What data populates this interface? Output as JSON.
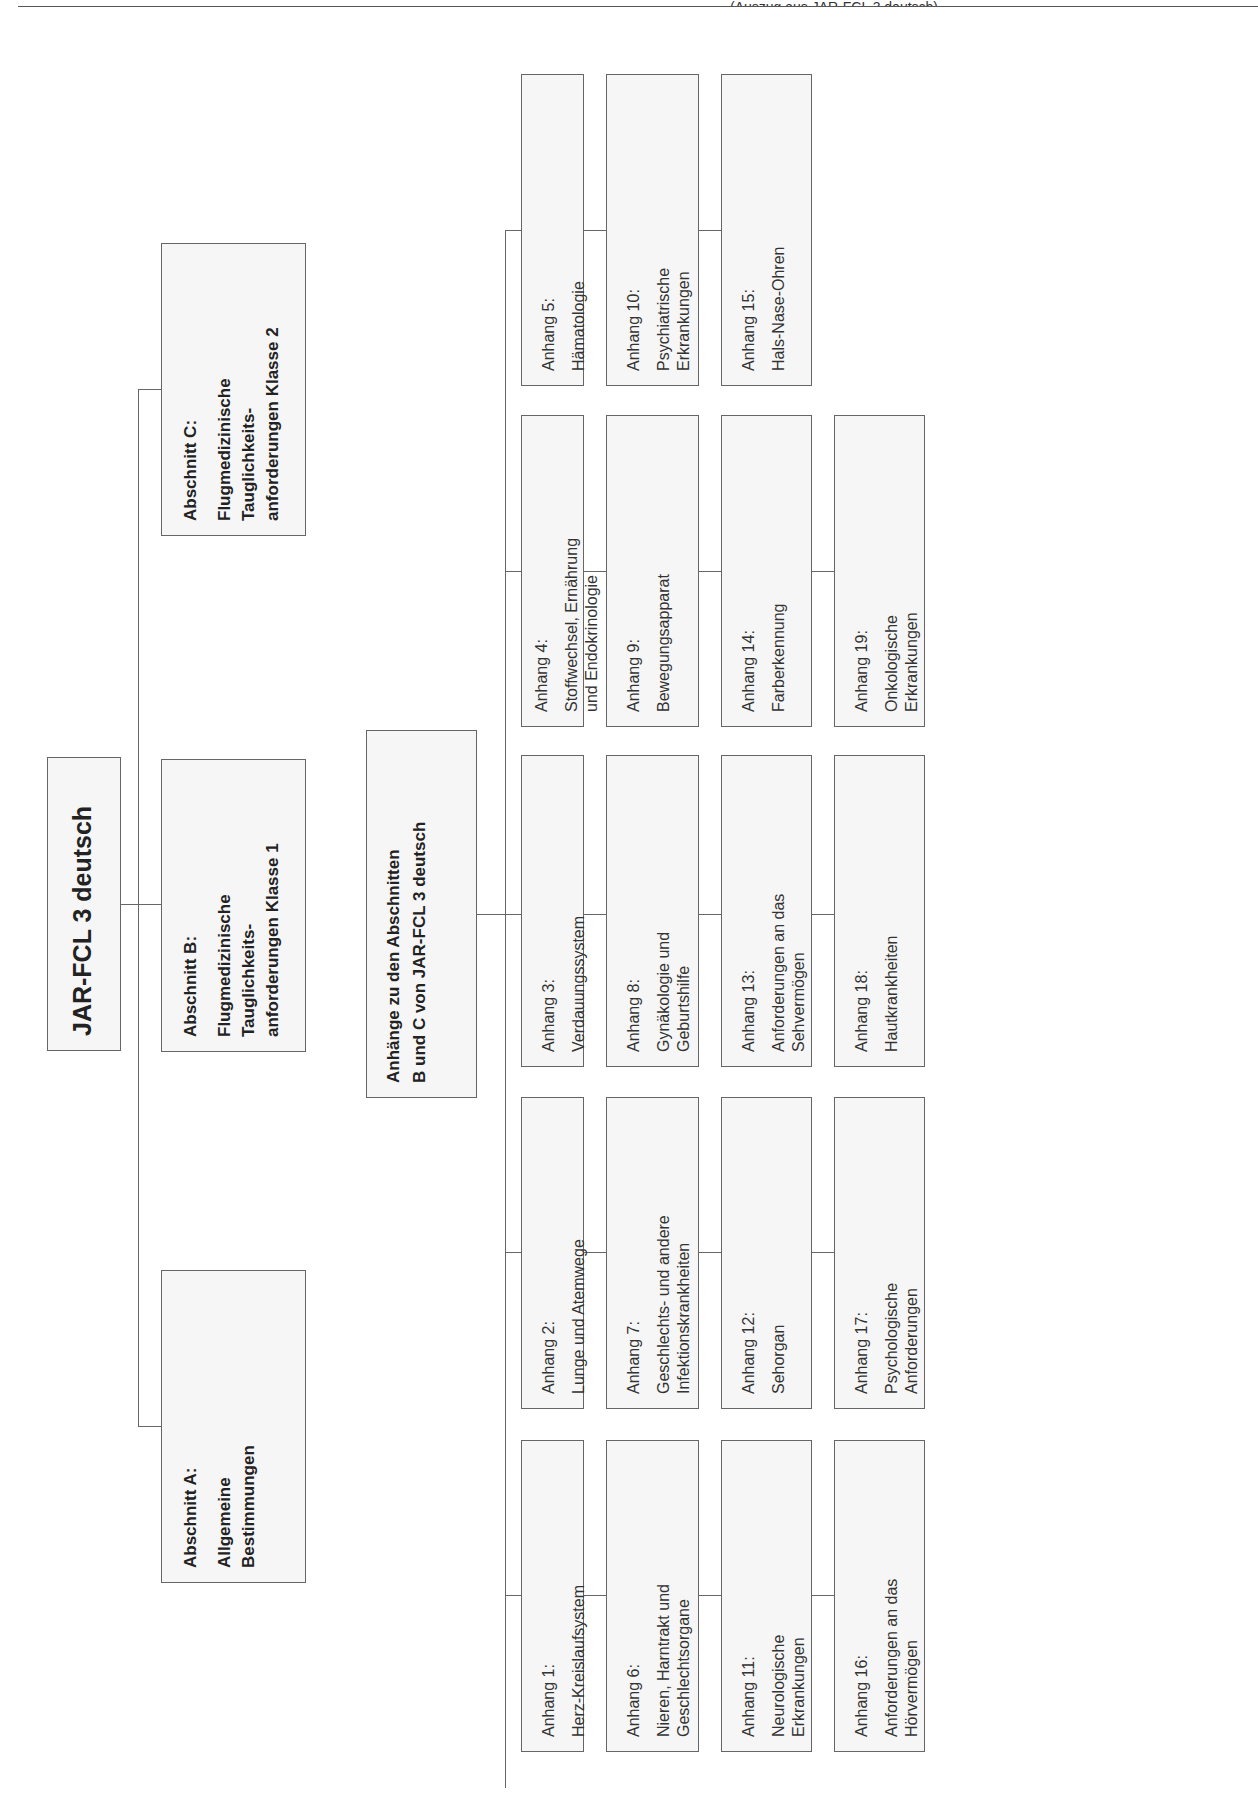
{
  "header": {
    "partial_text": "(Auszug aus JAR-FCL 3 deutsch)"
  },
  "root": {
    "title": "JAR-FCL 3 deutsch"
  },
  "sections": [
    {
      "id": "A",
      "heading": "Abschnitt A:",
      "lines": [
        "Allgemeine",
        "Bestimmungen"
      ]
    },
    {
      "id": "B",
      "heading": "Abschnitt B:",
      "lines": [
        "Flugmedizinische",
        "Tauglichkeits-",
        "anforderungen Klasse 1"
      ]
    },
    {
      "id": "C",
      "heading": "Abschnitt C:",
      "lines": [
        "Flugmedizinische",
        "Tauglichkeits-",
        "anforderungen Klasse 2"
      ]
    }
  ],
  "appendix_group": {
    "lines": [
      "Anhänge zu den Abschnitten",
      "B und C von JAR-FCL 3 deutsch"
    ]
  },
  "appendices": [
    {
      "label": "Anhang 1:",
      "lines": [
        "Herz-Kreislaufsystem"
      ]
    },
    {
      "label": "Anhang 2:",
      "lines": [
        "Lunge und Atemwege"
      ]
    },
    {
      "label": "Anhang 3:",
      "lines": [
        "Verdauungssystem"
      ]
    },
    {
      "label": "Anhang 4:",
      "lines": [
        "Stoffwechsel, Ernährung",
        "und Endokrinologie"
      ]
    },
    {
      "label": "Anhang 5:",
      "lines": [
        "Hämatologie"
      ]
    },
    {
      "label": "Anhang 6:",
      "lines": [
        "Nieren, Harntrakt und",
        "Geschlechtsorgane"
      ]
    },
    {
      "label": "Anhang 7:",
      "lines": [
        "Geschlechts- und andere",
        "Infektionskrankheiten"
      ]
    },
    {
      "label": "Anhang 8:",
      "lines": [
        "Gynäkologie und",
        "Geburtshilfe"
      ]
    },
    {
      "label": "Anhang 9:",
      "lines": [
        "Bewegungsapparat"
      ]
    },
    {
      "label": "Anhang 10:",
      "lines": [
        "Psychiatrische",
        "Erkrankungen"
      ]
    },
    {
      "label": "Anhang 11:",
      "lines": [
        "Neurologische",
        "Erkrankungen"
      ]
    },
    {
      "label": "Anhang 12:",
      "lines": [
        "Sehorgan"
      ]
    },
    {
      "label": "Anhang 13:",
      "lines": [
        "Anforderungen an das",
        "Sehvermögen"
      ]
    },
    {
      "label": "Anhang 14:",
      "lines": [
        "Farberkennung"
      ]
    },
    {
      "label": "Anhang 15:",
      "lines": [
        "Hals-Nase-Ohren"
      ]
    },
    {
      "label": "Anhang 16:",
      "lines": [
        "Anforderungen an das",
        "Hörvermögen"
      ]
    },
    {
      "label": "Anhang 17:",
      "lines": [
        "Psychologische",
        "Anforderungen"
      ]
    },
    {
      "label": "Anhang 18:",
      "lines": [
        "Hautkrankheiten"
      ]
    },
    {
      "label": "Anhang 19:",
      "lines": [
        "Onkologische",
        "Erkrankungen"
      ]
    }
  ],
  "colors": {
    "box_fill": "#f6f6f6",
    "box_border": "#666666",
    "line": "#666666",
    "text": "#222222"
  }
}
